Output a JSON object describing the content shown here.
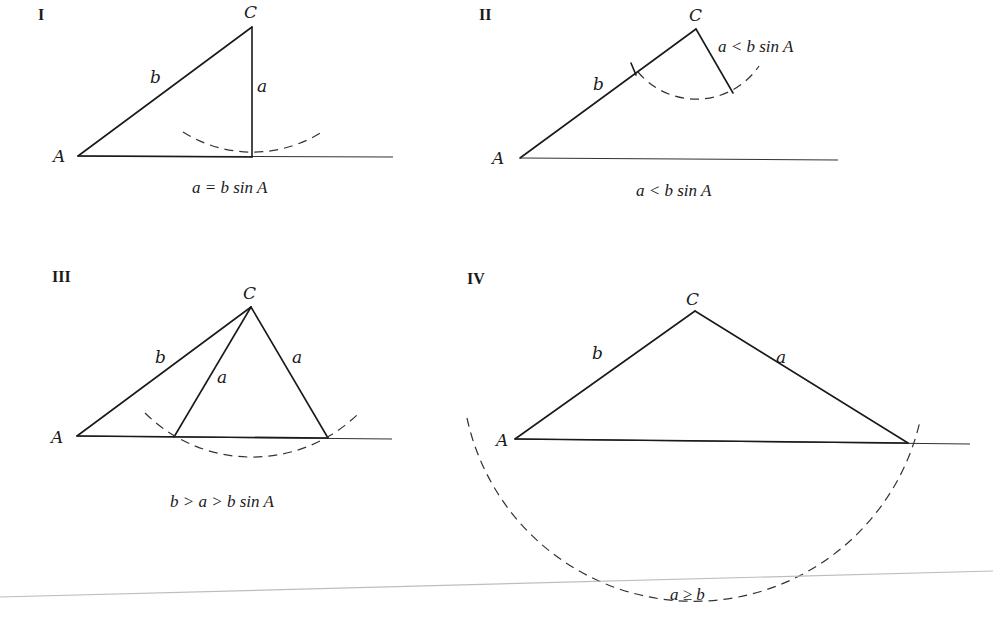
{
  "panels": [
    {
      "id": "I",
      "vertex_labels": {
        "A": "A",
        "C": "C"
      },
      "side_labels": {
        "b": "b",
        "a": "a"
      },
      "caption": "a = b sin A",
      "description": "Side a exactly reaches the base; one right triangle"
    },
    {
      "id": "II",
      "vertex_labels": {
        "A": "A",
        "C": "C"
      },
      "side_labels": {
        "b": "b"
      },
      "side_note": "a < b sin A",
      "caption": "a < b sin A",
      "description": "Side a too short to reach the base; no triangle"
    },
    {
      "id": "III",
      "vertex_labels": {
        "A": "A",
        "C": "C"
      },
      "side_labels": {
        "b": "b",
        "a1": "a",
        "a2": "a"
      },
      "caption": "b > a > b sin A",
      "description": "Arc intersects base twice; two triangles"
    },
    {
      "id": "IV",
      "vertex_labels": {
        "A": "A",
        "C": "C"
      },
      "side_labels": {
        "b": "b",
        "a": "a"
      },
      "caption": "a ≥ b",
      "description": "Arc intersects base once beyond A; one triangle"
    }
  ],
  "colors": {
    "ink": "#1a1a1a",
    "dash": "#333333",
    "rule": "#bdbdbd",
    "background": "#ffffff"
  }
}
